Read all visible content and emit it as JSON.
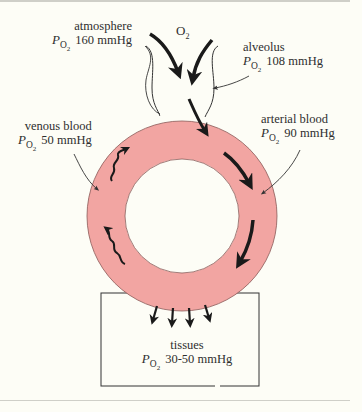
{
  "diagram": {
    "type": "oxygen-transport-cycle",
    "colors": {
      "ring_fill": "#f2a5a2",
      "ring_stroke": "#8a5a58",
      "line": "#333333",
      "arrow": "#1a1a1a",
      "background": "#fdfdf6"
    },
    "inflow_label": {
      "molecule": "O",
      "subscript": "2"
    },
    "symbol": {
      "p": "P",
      "o": "O",
      "sub": "2"
    },
    "labels": {
      "atmosphere": {
        "name": "atmosphere",
        "value": "160 mmHg"
      },
      "alveolus": {
        "name": "alveolus",
        "value": "108 mmHg"
      },
      "venous_blood": {
        "name": "venous blood",
        "value": "50 mmHg"
      },
      "arterial_blood": {
        "name": "arterial blood",
        "value": "90 mmHg"
      },
      "tissues": {
        "name": "tissues",
        "value": "30-50 mmHg"
      }
    }
  }
}
